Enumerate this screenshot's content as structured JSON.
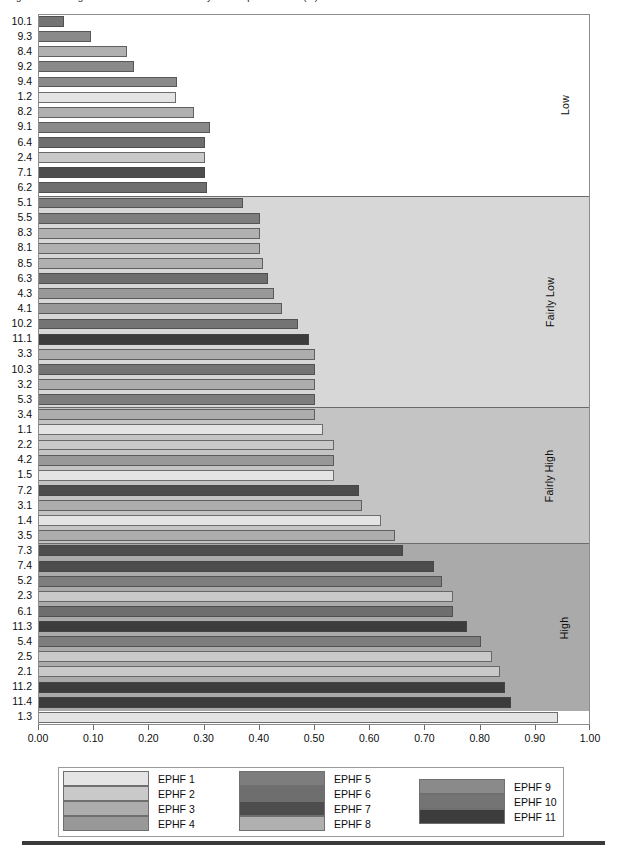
{
  "header": {
    "truncated_title": "Figure 5. Ranking of the EPHF sub-indicators by level of performance (%)"
  },
  "axis": {
    "x_ticks": [
      "0.00",
      "0.10",
      "0.20",
      "0.30",
      "0.40",
      "0.50",
      "0.60",
      "0.70",
      "0.80",
      "0.90",
      "1.00"
    ],
    "x_min": 0.0,
    "x_max": 1.0
  },
  "zones": [
    {
      "label": "Low",
      "color": "#ffffff",
      "count": 12
    },
    {
      "label": "Fairly Low",
      "color": "#d7d7d7",
      "count": 14
    },
    {
      "label": "Fairly High",
      "color": "#c4c4c4",
      "count": 9
    },
    {
      "label": "High",
      "color": "#aaaaaa",
      "count": 11
    }
  ],
  "series_colors": {
    "EPHF 1": "#e4e4e4",
    "EPHF 2": "#c9c9c9",
    "EPHF 3": "#adadad",
    "EPHF 4": "#989898",
    "EPHF 5": "#7d7d7d",
    "EPHF 6": "#6e6e6e",
    "EPHF 7": "#4d4d4d",
    "EPHF 8": "#b0b0b0",
    "EPHF 9": "#8a8a8a",
    "EPHF 10": "#747474",
    "EPHF 11": "#3c3c3c"
  },
  "legend": {
    "columns": [
      {
        "items": [
          "EPHF 1",
          "EPHF 2",
          "EPHF 3",
          "EPHF 4"
        ]
      },
      {
        "items": [
          "EPHF 5",
          "EPHF 6",
          "EPHF 7",
          "EPHF 8"
        ]
      },
      {
        "items": [
          "EPHF 9",
          "EPHF 10",
          "EPHF 11"
        ]
      }
    ]
  },
  "chart_data": {
    "type": "bar",
    "orientation": "horizontal",
    "title": "Ranking of the EPHF sub-indicators by level of performance",
    "xlabel": "",
    "ylabel": "",
    "xlim": [
      0.0,
      1.0
    ],
    "grid": false,
    "legend_position": "bottom",
    "categories": [
      "10.1",
      "9.3",
      "8.4",
      "9.2",
      "9.4",
      "1.2",
      "8.2",
      "9.1",
      "6.4",
      "2.4",
      "7.1",
      "6.2",
      "5.1",
      "5.5",
      "8.3",
      "8.1",
      "8.5",
      "6.3",
      "4.3",
      "4.1",
      "10.2",
      "11.1",
      "3.3",
      "10.3",
      "3.2",
      "5.3",
      "3.4",
      "1.1",
      "2.2",
      "4.2",
      "1.5",
      "7.2",
      "3.1",
      "1.4",
      "3.5",
      "7.3",
      "7.4",
      "5.2",
      "2.3",
      "6.1",
      "11.3",
      "5.4",
      "2.5",
      "2.1",
      "11.2",
      "11.4",
      "1.3"
    ],
    "values": [
      0.045,
      0.095,
      0.16,
      0.172,
      0.25,
      0.248,
      0.28,
      0.31,
      0.3,
      0.3,
      0.3,
      0.305,
      0.37,
      0.4,
      0.4,
      0.4,
      0.405,
      0.415,
      0.425,
      0.44,
      0.47,
      0.49,
      0.5,
      0.5,
      0.5,
      0.5,
      0.5,
      0.515,
      0.535,
      0.535,
      0.535,
      0.58,
      0.585,
      0.62,
      0.645,
      0.66,
      0.715,
      0.73,
      0.75,
      0.75,
      0.775,
      0.8,
      0.82,
      0.835,
      0.845,
      0.855,
      0.94
    ],
    "series_of_bar": [
      "EPHF 10",
      "EPHF 9",
      "EPHF 8",
      "EPHF 9",
      "EPHF 9",
      "EPHF 1",
      "EPHF 8",
      "EPHF 9",
      "EPHF 6",
      "EPHF 2",
      "EPHF 7",
      "EPHF 6",
      "EPHF 5",
      "EPHF 5",
      "EPHF 8",
      "EPHF 8",
      "EPHF 8",
      "EPHF 6",
      "EPHF 4",
      "EPHF 4",
      "EPHF 10",
      "EPHF 11",
      "EPHF 3",
      "EPHF 10",
      "EPHF 3",
      "EPHF 5",
      "EPHF 3",
      "EPHF 1",
      "EPHF 2",
      "EPHF 4",
      "EPHF 1",
      "EPHF 7",
      "EPHF 3",
      "EPHF 1",
      "EPHF 3",
      "EPHF 7",
      "EPHF 7",
      "EPHF 5",
      "EPHF 2",
      "EPHF 6",
      "EPHF 11",
      "EPHF 5",
      "EPHF 2",
      "EPHF 2",
      "EPHF 11",
      "EPHF 11",
      "EPHF 1"
    ],
    "zone_assignment": [
      "Low",
      "Low",
      "Low",
      "Low",
      "Low",
      "Low",
      "Low",
      "Low",
      "Low",
      "Low",
      "Low",
      "Low",
      "Fairly Low",
      "Fairly Low",
      "Fairly Low",
      "Fairly Low",
      "Fairly Low",
      "Fairly Low",
      "Fairly Low",
      "Fairly Low",
      "Fairly Low",
      "Fairly Low",
      "Fairly Low",
      "Fairly Low",
      "Fairly Low",
      "Fairly Low",
      "Fairly Low",
      "Fairly High",
      "Fairly High",
      "Fairly High",
      "Fairly High",
      "Fairly High",
      "Fairly High",
      "Fairly High",
      "Fairly High",
      "High",
      "High",
      "High",
      "High",
      "High",
      "High",
      "High",
      "High",
      "High",
      "High",
      "High"
    ]
  }
}
